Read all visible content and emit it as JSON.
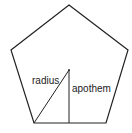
{
  "diagram": {
    "shape": "regular pentagon",
    "colors": {
      "stroke": "#222222",
      "background": "#ffffff"
    },
    "labels": {
      "radius": "radius",
      "apothem": "apothem"
    }
  }
}
